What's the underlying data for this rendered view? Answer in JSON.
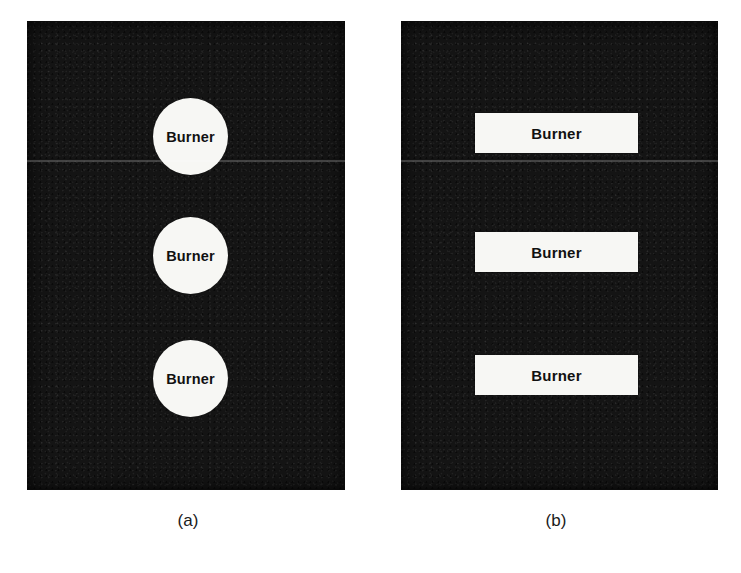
{
  "figure": {
    "type": "schematic-diagram",
    "background_color": "#ffffff",
    "panel_fill_color": "#111111",
    "burner_fill_color": "#f7f7f4",
    "burner_text_color": "#111111",
    "subfigures": [
      {
        "id": "a",
        "caption": "(a)",
        "burner_shape": "circle",
        "burner_count": 3,
        "burners": [
          {
            "label": "Burner"
          },
          {
            "label": "Burner"
          },
          {
            "label": "Burner"
          }
        ]
      },
      {
        "id": "b",
        "caption": "(b)",
        "burner_shape": "rectangle",
        "burner_count": 3,
        "burners": [
          {
            "label": "Burner"
          },
          {
            "label": "Burner"
          },
          {
            "label": "Burner"
          }
        ]
      }
    ]
  }
}
